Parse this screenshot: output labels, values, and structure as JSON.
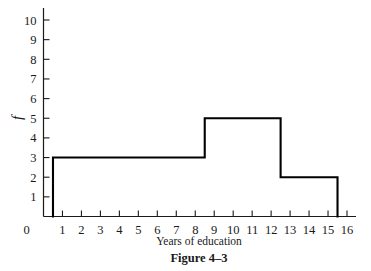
{
  "chart_data": {
    "type": "bar",
    "title": "",
    "xlabel": "Years of education",
    "ylabel": "f",
    "xlim": [
      0,
      16
    ],
    "ylim": [
      0,
      10.8
    ],
    "grid": false,
    "legend": null,
    "x_ticks": [
      "0",
      "1",
      "2",
      "3",
      "4",
      "5",
      "6",
      "7",
      "8",
      "9",
      "10",
      "11",
      "12",
      "13",
      "14",
      "15",
      "16"
    ],
    "x_tick_values": [
      0,
      1,
      2,
      3,
      4,
      5,
      6,
      7,
      8,
      9,
      10,
      11,
      12,
      13,
      14,
      15,
      16
    ],
    "y_ticks": [
      "1",
      "2",
      "3",
      "4",
      "5",
      "6",
      "7",
      "8",
      "9",
      "10"
    ],
    "y_tick_values": [
      1,
      2,
      3,
      4,
      5,
      6,
      7,
      8,
      9,
      10
    ],
    "bars": [
      {
        "label": "0.5-8.5",
        "start": 0.5,
        "end": 8.5,
        "value": 3
      },
      {
        "label": "8.5-12.5",
        "start": 8.5,
        "end": 12.5,
        "value": 5
      },
      {
        "label": "12.5-15.5",
        "start": 12.5,
        "end": 15.5,
        "value": 2
      }
    ],
    "categories": [
      "0.5-8.5",
      "8.5-12.5",
      "12.5-15.5"
    ],
    "values": [
      3,
      5,
      2
    ],
    "line_color": "#000000",
    "fill_color": "#ffffff"
  },
  "caption": {
    "figure_label": "Figure 4–3"
  },
  "axes": {
    "x_axis_title": "Years of education",
    "y_axis_title": "f"
  }
}
